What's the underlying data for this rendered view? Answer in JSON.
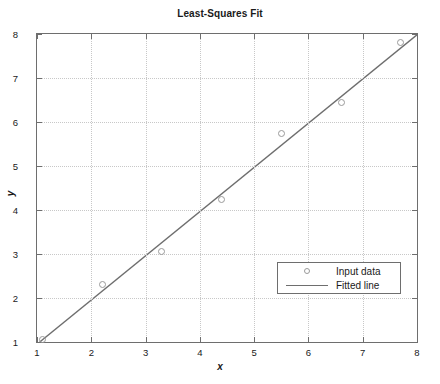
{
  "chart_data": {
    "type": "scatter",
    "title": "Least-Squares Fit",
    "xlabel": "x",
    "ylabel": "y",
    "xlim": [
      1,
      8
    ],
    "ylim": [
      1,
      8
    ],
    "xticks": [
      "1",
      "2",
      "3",
      "4",
      "5",
      "6",
      "7",
      "8"
    ],
    "yticks": [
      "1",
      "2",
      "3",
      "4",
      "5",
      "6",
      "7",
      "8"
    ],
    "grid": true,
    "legend_position": "lower right",
    "series": [
      {
        "name": "Input data",
        "type": "scatter",
        "marker": "circle-open",
        "color": "#9a9a9a",
        "points": [
          {
            "x": 1.1,
            "y": 1.05
          },
          {
            "x": 2.2,
            "y": 2.3
          },
          {
            "x": 3.3,
            "y": 3.05
          },
          {
            "x": 4.4,
            "y": 4.25
          },
          {
            "x": 5.5,
            "y": 5.75
          },
          {
            "x": 6.6,
            "y": 6.45
          },
          {
            "x": 7.7,
            "y": 7.8
          }
        ]
      },
      {
        "name": "Fitted line",
        "type": "line",
        "color": "#6e6e6e",
        "points": [
          {
            "x": 1.05,
            "y": 1.0
          },
          {
            "x": 8.0,
            "y": 7.98
          }
        ]
      }
    ]
  },
  "legend": {
    "entries": [
      {
        "label": "Input data",
        "symbol": "circle-marker"
      },
      {
        "label": "Fitted line",
        "symbol": "line-segment"
      }
    ]
  }
}
